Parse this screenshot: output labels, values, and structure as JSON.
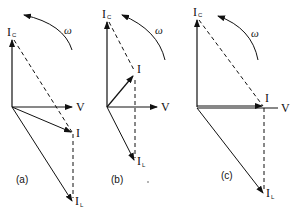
{
  "figure": {
    "panels": [
      {
        "caption": "(a)",
        "labels": {
          "ic": "I",
          "ic_sub": "C",
          "v": "V",
          "i": "I",
          "il": "I",
          "il_sub": "L",
          "omega": "ω"
        }
      },
      {
        "caption": "(b)",
        "labels": {
          "ic": "I",
          "ic_sub": "C",
          "v": "V",
          "i": "I",
          "il": "I",
          "il_sub": "L",
          "omega": "ω"
        }
      },
      {
        "caption": "(c)",
        "labels": {
          "ic": "I",
          "ic_sub": "C",
          "v": "V",
          "i": "I",
          "il": "I",
          "il_sub": "L",
          "omega": "ω"
        }
      }
    ],
    "stroke_color": "#111111",
    "background": "#ffffff"
  }
}
